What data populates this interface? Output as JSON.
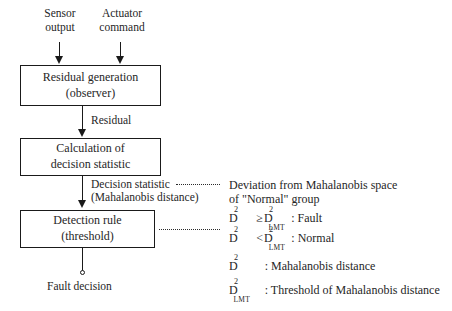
{
  "diagram": {
    "inputs": [
      {
        "line1": "Sensor",
        "line2": "output"
      },
      {
        "line1": "Actuator",
        "line2": "command"
      }
    ],
    "boxes": [
      {
        "line1": "Residual generation",
        "line2": "(observer)"
      },
      {
        "line1": "Calculation of",
        "line2": "decision statistic"
      },
      {
        "line1": "Detection rule",
        "line2": "(threshold)"
      }
    ],
    "edges": [
      {
        "label": "Residual"
      },
      {
        "label_line1": "Decision statistic",
        "label_line2": "(Mahalanobis distance)"
      }
    ],
    "output": {
      "label": "Fault decision"
    }
  },
  "legend": {
    "deviation_line1": "Deviation from Mahalanobis space",
    "deviation_line2": "of \"Normal\" group",
    "rules": [
      {
        "lhs": "D",
        "lhs_sup": "2",
        "op": "≥",
        "rhs": "D",
        "rhs_sup": "2",
        "rhs_sub": "LMT",
        "colon": ":",
        "result": "Fault"
      },
      {
        "lhs": "D",
        "lhs_sup": "2",
        "op": "<",
        "rhs": "D",
        "rhs_sup": "2",
        "rhs_sub": "LMT",
        "colon": ":",
        "result": "Normal"
      }
    ],
    "definitions": [
      {
        "symbol": "D",
        "symbol_sup": "2",
        "symbol_sub": "",
        "colon": ":",
        "text": "Mahalanobis distance"
      },
      {
        "symbol": "D",
        "symbol_sup": "2",
        "symbol_sub": "LMT",
        "colon": ":",
        "text": "Threshold of Mahalanobis distance"
      }
    ]
  },
  "colors": {
    "stroke": "#1a1a1a",
    "text": "#262626",
    "background": "#ffffff"
  }
}
